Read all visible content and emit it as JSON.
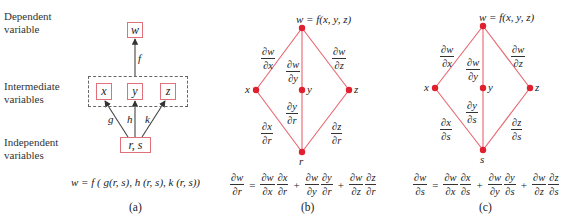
{
  "panel_a": {
    "labels": {
      "dependent": [
        "Dependent",
        "variable"
      ],
      "intermediate": [
        "Intermediate",
        "variables"
      ],
      "independent": [
        "Independent",
        "variables"
      ]
    },
    "boxes": {
      "w": "w",
      "x": "x",
      "y": "y",
      "z": "z",
      "rs": "r, s"
    },
    "edge_labels": {
      "f": "f",
      "g": "g",
      "h": "h",
      "k": "k"
    },
    "equation": "w = f ( g(r, s), h (r, s), k (r, s))",
    "caption": "(a)"
  },
  "panel_b": {
    "top_label": "w = f(x, y, z)",
    "nodes": {
      "x": "x",
      "y": "y",
      "z": "z",
      "bottom": "r"
    },
    "upper_fracs": [
      {
        "num": "∂w",
        "den": "∂x"
      },
      {
        "num": "∂w",
        "den": "∂y"
      },
      {
        "num": "∂w",
        "den": "∂z"
      }
    ],
    "lower_fracs": [
      {
        "num": "∂x",
        "den": "∂r"
      },
      {
        "num": "∂y",
        "den": "∂r"
      },
      {
        "num": "∂z",
        "den": "∂r"
      }
    ],
    "equation": {
      "lhs": {
        "num": "∂w",
        "den": "∂r"
      },
      "terms": [
        [
          {
            "num": "∂w",
            "den": "∂x"
          },
          {
            "num": "∂x",
            "den": "∂r"
          }
        ],
        [
          {
            "num": "∂w",
            "den": "∂y"
          },
          {
            "num": "∂y",
            "den": "∂r"
          }
        ],
        [
          {
            "num": "∂w",
            "den": "∂z"
          },
          {
            "num": "∂z",
            "den": "∂r"
          }
        ]
      ],
      "eq_sign": "=",
      "plus": "+"
    },
    "caption": "(b)"
  },
  "panel_c": {
    "top_label": "w = f(x, y, z)",
    "nodes": {
      "x": "x",
      "y": "y",
      "z": "z",
      "bottom": "s"
    },
    "upper_fracs": [
      {
        "num": "∂w",
        "den": "∂x"
      },
      {
        "num": "∂w",
        "den": "∂y"
      },
      {
        "num": "∂w",
        "den": "∂z"
      }
    ],
    "lower_fracs": [
      {
        "num": "∂x",
        "den": "∂s"
      },
      {
        "num": "∂y",
        "den": "∂s"
      },
      {
        "num": "∂z",
        "den": "∂s"
      }
    ],
    "equation": {
      "lhs": {
        "num": "∂w",
        "den": "∂s"
      },
      "terms": [
        [
          {
            "num": "∂w",
            "den": "∂x"
          },
          {
            "num": "∂x",
            "den": "∂s"
          }
        ],
        [
          {
            "num": "∂w",
            "den": "∂y"
          },
          {
            "num": "∂y",
            "den": "∂s"
          }
        ],
        [
          {
            "num": "∂w",
            "den": "∂z"
          },
          {
            "num": "∂z",
            "den": "∂s"
          }
        ]
      ],
      "eq_sign": "=",
      "plus": "+"
    },
    "caption": "(c)"
  },
  "colors": {
    "line": "#e8646e",
    "node": "#e0202e",
    "box_border": "#e0707a",
    "dashed": "#666666",
    "arrow": "#333333"
  }
}
